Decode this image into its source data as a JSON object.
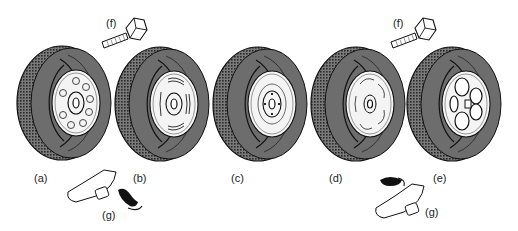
{
  "figure": {
    "colors": {
      "ink": "#111111",
      "tyre": "#6d6d6d",
      "tread": "#3a3a3a",
      "rim": "#f4f4f4",
      "background": "#ffffff"
    },
    "wheels": [
      {
        "id": "a",
        "label": "(a)",
        "style": "steel wheel with circular vents"
      },
      {
        "id": "b",
        "label": "(b)",
        "style": "steel wheel with slotted vents"
      },
      {
        "id": "c",
        "label": "(c)",
        "style": "plain steel wheel with hub cap"
      },
      {
        "id": "d",
        "label": "(d)",
        "style": "wheel with curved swirl trim"
      },
      {
        "id": "e",
        "label": "(e)",
        "style": "alloy wheel with four large openings"
      }
    ],
    "parts": [
      {
        "id": "f1",
        "label": "(f)",
        "name": "wheel bolt"
      },
      {
        "id": "f2",
        "label": "(f)",
        "name": "wheel bolt"
      },
      {
        "id": "g1",
        "label": "(g)",
        "name": "balance weight (clip-on and adhesive)"
      },
      {
        "id": "g2",
        "label": "(g)",
        "name": "balance weight (clip-on and adhesive)"
      }
    ]
  }
}
